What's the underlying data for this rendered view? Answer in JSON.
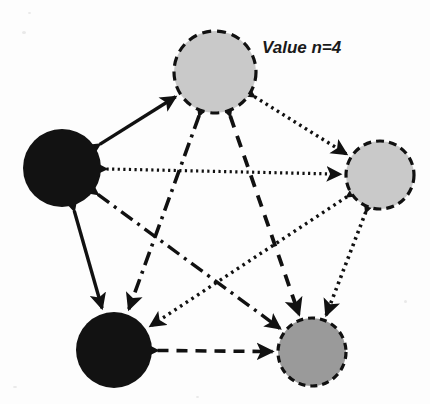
{
  "figure": {
    "width": 430,
    "height": 404,
    "background_color": "#fdfdfd",
    "annotation": {
      "text": "Value n=4",
      "x": 262,
      "y": 53,
      "color": "#1a1a1a"
    }
  },
  "palette": {
    "node_black": "#121212",
    "node_light_gray": "#c9c9c9",
    "node_mid_gray": "#9a9a9a",
    "stroke_black": "#111111",
    "background": "#fdfdfd"
  },
  "nodes": [
    {
      "id": "top",
      "label": "top-node",
      "cx": 215,
      "cy": 72,
      "r": 41,
      "fill": "#c9c9c9",
      "stroke": "#111111",
      "stroke_width": 3.2,
      "border_style": "dashed",
      "dash_pattern": "9,6"
    },
    {
      "id": "right",
      "label": "right-node",
      "cx": 380,
      "cy": 175,
      "r": 34,
      "fill": "#c9c9c9",
      "stroke": "#111111",
      "stroke_width": 3.2,
      "border_style": "dashed",
      "dash_pattern": "8,5"
    },
    {
      "id": "bottom-right",
      "label": "bottom-right-node",
      "cx": 312,
      "cy": 352,
      "r": 34,
      "fill": "#9a9a9a",
      "stroke": "#111111",
      "stroke_width": 3.2,
      "border_style": "dashed",
      "dash_pattern": "7,5"
    },
    {
      "id": "bottom-left",
      "label": "bottom-left-node",
      "cx": 114,
      "cy": 350,
      "r": 38,
      "fill": "#121212",
      "stroke": "none",
      "stroke_width": 0,
      "border_style": "none",
      "dash_pattern": ""
    },
    {
      "id": "left",
      "label": "left-node",
      "cx": 62,
      "cy": 168,
      "r": 39,
      "fill": "#121212",
      "stroke": "none",
      "stroke_width": 0,
      "border_style": "none",
      "dash_pattern": ""
    }
  ],
  "edges": [
    {
      "id": "left-top",
      "from": "left",
      "to": "top",
      "style": "solid",
      "dash_pattern": "",
      "stroke_width": 3.4,
      "arrows": "both"
    },
    {
      "id": "left-bottomleft",
      "from": "left",
      "to": "bottom-left",
      "style": "solid",
      "dash_pattern": "",
      "stroke_width": 3.4,
      "arrows": "both"
    },
    {
      "id": "left-right",
      "from": "left",
      "to": "right",
      "style": "dotted",
      "dash_pattern": "2.2,3.4",
      "stroke_width": 3.2,
      "arrows": "both"
    },
    {
      "id": "top-right",
      "from": "top",
      "to": "right",
      "style": "dotted",
      "dash_pattern": "2.6,4",
      "stroke_width": 3.4,
      "arrows": "both"
    },
    {
      "id": "right-bottomright",
      "from": "right",
      "to": "bottom-right",
      "style": "dotted",
      "dash_pattern": "2.6,4.2",
      "stroke_width": 3.6,
      "arrows": "both"
    },
    {
      "id": "bottomleft-bottomright",
      "from": "bottom-left",
      "to": "bottom-right",
      "style": "dashed",
      "dash_pattern": "11,8",
      "stroke_width": 3.6,
      "arrows": "both"
    },
    {
      "id": "top-bottomright",
      "from": "top",
      "to": "bottom-right",
      "style": "dashed",
      "dash_pattern": "12,9",
      "stroke_width": 3.8,
      "arrows": "both"
    },
    {
      "id": "top-bottomleft",
      "from": "top",
      "to": "bottom-left",
      "style": "dash-dot",
      "dash_pattern": "14,6,3,6",
      "stroke_width": 3.6,
      "arrows": "both"
    },
    {
      "id": "left-bottomright",
      "from": "left",
      "to": "bottom-right",
      "style": "dash-dot",
      "dash_pattern": "14,6,3,6",
      "stroke_width": 3.4,
      "arrows": "both"
    },
    {
      "id": "right-bottomleft",
      "from": "right",
      "to": "bottom-left",
      "style": "dotted",
      "dash_pattern": "2.6,4.2",
      "stroke_width": 3.4,
      "arrows": "both"
    }
  ],
  "chart_data": {
    "type": "diagram",
    "subtype": "directed-network-graph",
    "title": "",
    "annotation": "Value n=4",
    "node_count": 5,
    "edge_count": 10,
    "node_fills": [
      "#c9c9c9",
      "#c9c9c9",
      "#9a9a9a",
      "#121212",
      "#121212"
    ],
    "line_styles_used": [
      "solid",
      "dashed",
      "dotted",
      "dash-dot"
    ]
  }
}
